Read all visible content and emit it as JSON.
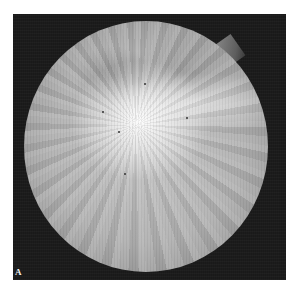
{
  "figure": {
    "panel_label": "A",
    "colors": {
      "background": "#ffffff",
      "frame": "#1c1c1c",
      "fundus_center": "#c8c8c8",
      "fundus_edge": "#6e6e6e",
      "label": "#f2f2f2"
    }
  }
}
